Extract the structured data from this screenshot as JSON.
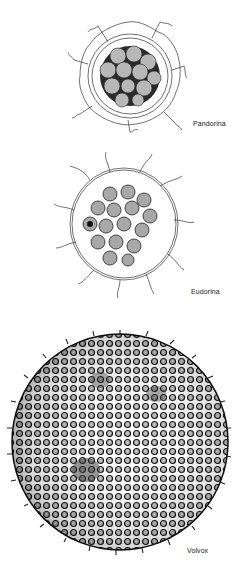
{
  "figure": {
    "organisms": [
      {
        "name": "Pandorina",
        "cells": 16
      },
      {
        "name": "Eudorina",
        "cells": 32
      },
      {
        "name": "Volvox",
        "cells": "many"
      }
    ]
  },
  "labels": {
    "pandorina": "Pandorina",
    "eudorina": "Eudorina",
    "volvox": "Volvox"
  }
}
